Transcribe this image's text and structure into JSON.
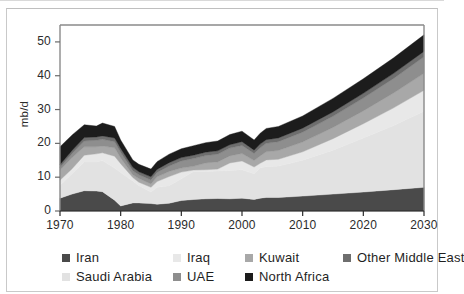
{
  "chart_data": {
    "type": "area",
    "title": "",
    "xlabel": "",
    "ylabel": "mb/d",
    "stacked": true,
    "grid": false,
    "legend_position": "bottom",
    "xlim": [
      1970,
      2030
    ],
    "ylim": [
      0,
      55
    ],
    "x_ticks": [
      "1970",
      "1980",
      "1990",
      "2000",
      "2010",
      "2020",
      "2030"
    ],
    "y_ticks": [
      "0",
      "10",
      "20",
      "30",
      "40",
      "50"
    ],
    "x": [
      1970,
      1972,
      1974,
      1976,
      1977,
      1979,
      1980,
      1982,
      1983,
      1985,
      1986,
      1988,
      1990,
      1992,
      1994,
      1996,
      1998,
      2000,
      2002,
      2003,
      2004,
      2006,
      2010,
      2015,
      2020,
      2025,
      2030
    ],
    "series": [
      {
        "name": "Iran",
        "color": "#4a4a4a",
        "values": [
          3.8,
          5.0,
          6.0,
          5.9,
          5.7,
          3.2,
          1.5,
          2.4,
          2.4,
          2.2,
          2.0,
          2.3,
          3.1,
          3.4,
          3.6,
          3.7,
          3.6,
          3.8,
          3.4,
          3.8,
          4.0,
          4.0,
          4.4,
          5.0,
          5.6,
          6.3,
          7.0
        ]
      },
      {
        "name": "Saudi Arabia",
        "color": "#e2e2e2",
        "values": [
          3.8,
          6.0,
          8.5,
          8.6,
          9.2,
          9.5,
          9.9,
          6.5,
          5.1,
          3.4,
          5.0,
          5.2,
          6.4,
          8.3,
          8.1,
          8.1,
          8.4,
          8.4,
          7.6,
          9.0,
          9.1,
          9.3,
          10.6,
          13.0,
          16.0,
          19.0,
          22.5
        ]
      },
      {
        "name": "Iraq",
        "color": "#e8e8e8",
        "values": [
          1.5,
          1.5,
          2.0,
          2.4,
          2.3,
          3.5,
          2.6,
          1.0,
          1.0,
          1.4,
          1.7,
          2.7,
          2.0,
          0.4,
          0.5,
          0.6,
          2.2,
          2.6,
          2.0,
          1.3,
          2.0,
          2.0,
          2.5,
          3.4,
          4.2,
          5.2,
          6.2
        ]
      },
      {
        "name": "Kuwait",
        "color": "#a8a8a8",
        "values": [
          3.0,
          3.3,
          2.5,
          2.1,
          2.0,
          2.5,
          1.7,
          0.8,
          1.1,
          1.0,
          1.4,
          1.5,
          1.2,
          1.1,
          2.0,
          2.1,
          2.1,
          2.2,
          1.9,
          2.2,
          2.4,
          2.6,
          2.9,
          3.3,
          3.8,
          4.4,
          5.0
        ]
      },
      {
        "name": "UAE",
        "color": "#8e8e8e",
        "values": [
          0.8,
          1.2,
          1.7,
          1.9,
          2.0,
          1.8,
          1.7,
          1.2,
          1.1,
          1.2,
          1.3,
          1.6,
          2.1,
          2.3,
          2.2,
          2.3,
          2.3,
          2.4,
          2.1,
          2.4,
          2.5,
          2.6,
          2.9,
          3.3,
          3.8,
          4.3,
          4.9
        ]
      },
      {
        "name": "Other Middle East",
        "color": "#6e6e6e",
        "values": [
          0.8,
          0.9,
          1.0,
          1.0,
          1.0,
          1.1,
          1.1,
          1.0,
          0.9,
          0.9,
          0.9,
          1.0,
          1.0,
          1.0,
          1.0,
          1.0,
          1.0,
          1.1,
          1.0,
          1.1,
          1.1,
          1.1,
          1.2,
          1.3,
          1.4,
          1.5,
          1.6
        ]
      },
      {
        "name": "North Africa",
        "color": "#1c1c1c",
        "values": [
          5.3,
          4.6,
          3.8,
          3.2,
          3.8,
          3.4,
          2.5,
          2.2,
          2.2,
          2.3,
          2.3,
          2.5,
          2.6,
          2.8,
          2.8,
          2.9,
          3.0,
          3.1,
          3.0,
          3.2,
          3.3,
          3.4,
          3.6,
          4.0,
          4.3,
          4.6,
          4.9
        ]
      }
    ],
    "totals_note": ""
  },
  "axes": {
    "ylabel": "mb/d",
    "y_ticks": [
      "50",
      "40",
      "30",
      "20",
      "10",
      "0"
    ],
    "x_ticks": [
      "1970",
      "1980",
      "1990",
      "2000",
      "2010",
      "2020",
      "2030"
    ]
  },
  "legend": {
    "row1": [
      {
        "label": "Iran",
        "color": "#4a4a4a"
      },
      {
        "label": "Iraq",
        "color": "#e8e8e8"
      },
      {
        "label": "Kuwait",
        "color": "#a8a8a8"
      },
      {
        "label": "Other Middle East",
        "color": "#6e6e6e"
      }
    ],
    "row2": [
      {
        "label": "Saudi Arabia",
        "color": "#e2e2e2"
      },
      {
        "label": "UAE",
        "color": "#8e8e8e"
      },
      {
        "label": "North Africa",
        "color": "#1c1c1c"
      }
    ]
  }
}
